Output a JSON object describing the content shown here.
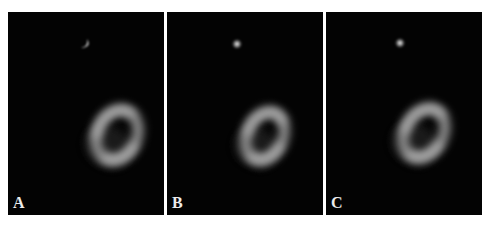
{
  "figure": {
    "background": "#ffffff",
    "panel_background": "#030303",
    "label_color": "#ececec",
    "panels": [
      {
        "label": "A",
        "x": 8,
        "w": 156,
        "spot": {
          "cx": 77,
          "cy": 32,
          "r": 4,
          "shape": "crescent"
        },
        "ring": {
          "cx": 109,
          "cy": 123,
          "rx": 20,
          "ry": 26,
          "rot": 25
        }
      },
      {
        "label": "B",
        "x": 167,
        "w": 156,
        "spot": {
          "cx": 70,
          "cy": 32,
          "r": 3,
          "shape": "dot"
        },
        "ring": {
          "cx": 98,
          "cy": 124,
          "rx": 18,
          "ry": 25,
          "rot": 25
        }
      },
      {
        "label": "C",
        "x": 326,
        "w": 156,
        "spot": {
          "cx": 74,
          "cy": 31,
          "r": 3,
          "shape": "dot"
        },
        "ring": {
          "cx": 98,
          "cy": 121,
          "rx": 19,
          "ry": 26,
          "rot": 30
        }
      }
    ]
  }
}
